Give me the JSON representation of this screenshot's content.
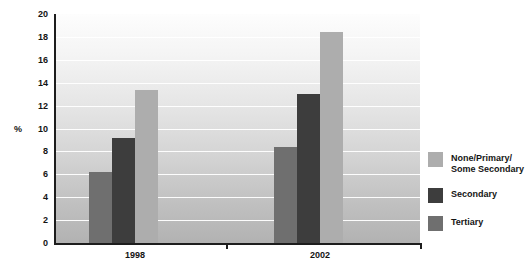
{
  "chart_data": {
    "type": "bar",
    "title": "",
    "xlabel": "",
    "ylabel": "%",
    "ylim": [
      0,
      20
    ],
    "ytick_step": 2,
    "yticks": [
      20,
      18,
      16,
      14,
      12,
      10,
      8,
      6,
      4,
      2,
      0
    ],
    "grid": true,
    "grid_orientation": "horizontal",
    "legend_position": "right",
    "categories": [
      "1998",
      "2002"
    ],
    "series": [
      {
        "name": "Tertiary",
        "color": "#6f6f6f",
        "values": [
          6.2,
          8.4
        ]
      },
      {
        "name": "Secondary",
        "color": "#3d3d3d",
        "values": [
          9.2,
          13.0
        ]
      },
      {
        "name": "None/Primary/\nSome Secondary",
        "color": "#adadad",
        "values": [
          13.4,
          18.4
        ]
      }
    ],
    "legend_entries": [
      {
        "label": "None/Primary/\nSome Secondary",
        "color": "#adadad"
      },
      {
        "label": "Secondary",
        "color": "#3d3d3d"
      },
      {
        "label": "Tertiary",
        "color": "#6f6f6f"
      }
    ]
  },
  "axis": {
    "y_title": "%",
    "tick_20": "20",
    "tick_18": "18",
    "tick_16": "16",
    "tick_14": "14",
    "tick_12": "12",
    "tick_10": "10",
    "tick_8": "8",
    "tick_6": "6",
    "tick_4": "4",
    "tick_2": "2",
    "tick_0": "0",
    "cat_1": "1998",
    "cat_2": "2002"
  },
  "legend": {
    "item_1": "None/Primary/\nSome Secondary",
    "item_2": "Secondary",
    "item_3": "Tertiary"
  },
  "colors": {
    "none_primary": "#adadad",
    "secondary": "#3d3d3d",
    "tertiary": "#6f6f6f",
    "axis": "#1d1d1d",
    "text": "#141414",
    "gridline": "#ffffff"
  }
}
